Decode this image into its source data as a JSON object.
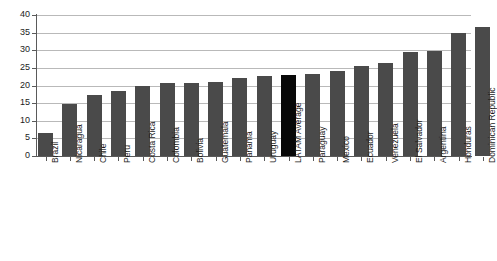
{
  "chart_data": {
    "type": "bar",
    "title": "",
    "subtitle": "",
    "xlabel": "",
    "ylabel": "",
    "ylim": [
      0,
      40
    ],
    "ytick_values": [
      0,
      5,
      10,
      15,
      20,
      25,
      30,
      35,
      40
    ],
    "ytick_labels": [
      "0",
      "5",
      "10",
      "15",
      "20",
      "25",
      "30",
      "35",
      "40"
    ],
    "grid": true,
    "legend": "none",
    "orientation": "vertical",
    "categories": [
      "Brazil",
      "Nicaragua",
      "Chile",
      "Peru",
      "Costa Rica",
      "Colombia",
      "Bolivia",
      "Guatemala",
      "Panama",
      "Uruguay",
      "LATAM Average",
      "Paraguay",
      "Mexico",
      "Ecuador",
      "Venezuela",
      "El Salvador",
      "Argentina",
      "Honduras",
      "Dominican Republic"
    ],
    "values": [
      6.5,
      14.7,
      17.3,
      18.3,
      19.8,
      20.6,
      20.7,
      21.0,
      22.2,
      22.6,
      23.0,
      23.2,
      24.0,
      25.5,
      26.3,
      29.5,
      29.7,
      34.8,
      36.5
    ],
    "highlight_category": "LATAM Average",
    "colors": {
      "bar": "#4a4a4a",
      "bar_highlight": "#080808",
      "gridline": "#b9b9b9",
      "axis": "#5a5a5a",
      "background": "#ffffff",
      "text": "#1c1c1c"
    }
  }
}
